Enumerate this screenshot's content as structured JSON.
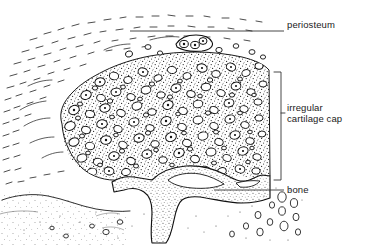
{
  "figure": {
    "width": 370,
    "height": 245,
    "background_color": "#ffffff",
    "ink_color": "#1a1a1a"
  },
  "labels": [
    {
      "id": "periosteum",
      "text": "periosteum",
      "callout": "leader-line",
      "x": 287,
      "y": 20
    },
    {
      "id": "cartilage",
      "text_line_1": "irregular",
      "text_line_2": "cartilage cap",
      "callout": "bracket",
      "x": 287,
      "y": 103
    },
    {
      "id": "bone",
      "text": "bone",
      "callout": "leader-line",
      "x": 287,
      "y": 185
    }
  ],
  "regions": [
    {
      "name": "periosteum-fibrous-layer",
      "description": "upper-left sparse dash hatching representing fibrous periosteum"
    },
    {
      "name": "cartilage-cap",
      "description": "dense stippled matrix with numerous elliptical lacunae containing chondrocytes"
    },
    {
      "name": "bone-trabecula",
      "description": "irregular branching stippled trabecular bone at lower centre"
    },
    {
      "name": "marrow-space",
      "description": "lower-left lightly stippled marrow / subperiosteal space bounded by a wavy line"
    }
  ],
  "annotations": {
    "cell_marker": "lacuna-ellipse",
    "matrix_marker": "stipple-dot",
    "fibre_marker": "dash-stroke"
  }
}
